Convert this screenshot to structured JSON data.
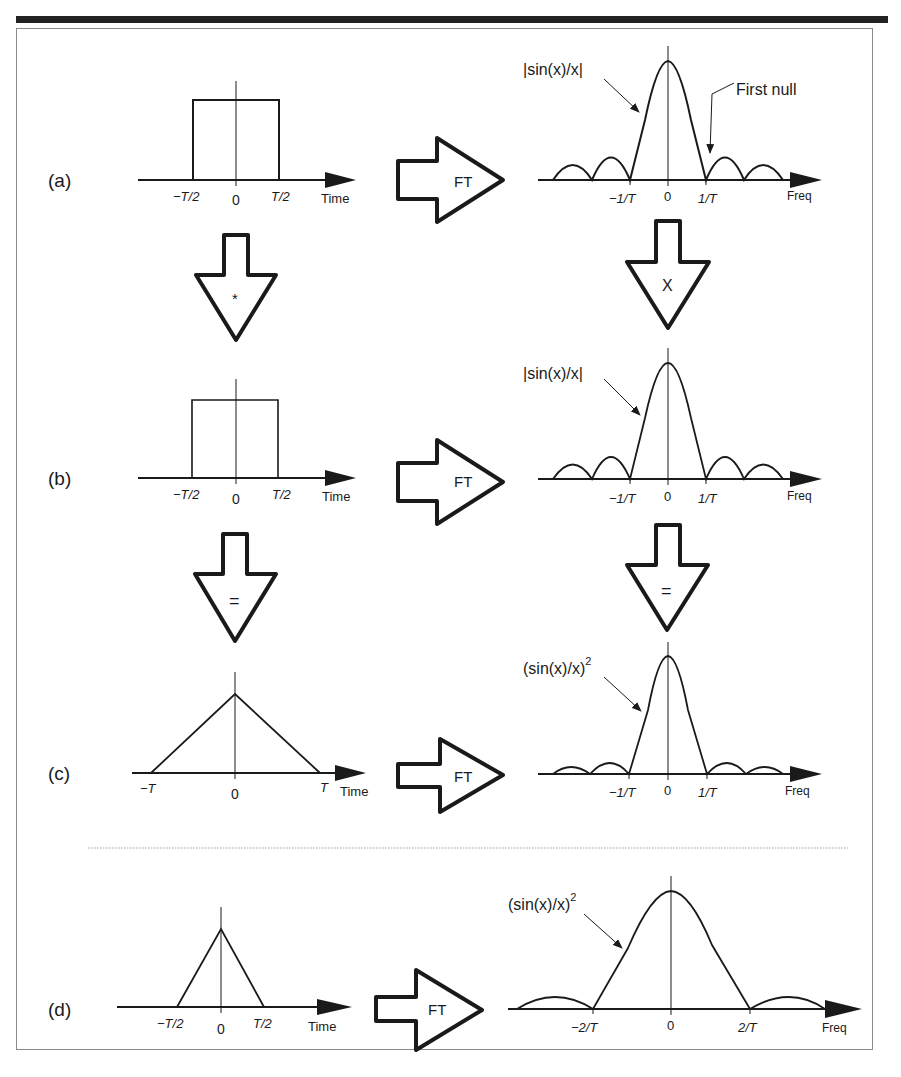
{
  "figure": {
    "rows": [
      {
        "id": "a",
        "label": "(a)",
        "time": {
          "shape": "rect",
          "ticks": [
            "−T/2",
            "0",
            "T/2"
          ],
          "axis_label": "Time"
        },
        "transform": "FT",
        "freq": {
          "shape": "|sin(x)/x|",
          "curve_label": "|sin(x)/x|",
          "annotation": "First null",
          "ticks": [
            "−1/T",
            "0",
            "1/T"
          ],
          "axis_label": "Freq"
        }
      },
      {
        "id": "b",
        "label": "(b)",
        "time": {
          "shape": "rect",
          "ticks": [
            "−T/2",
            "0",
            "T/2"
          ],
          "axis_label": "Time"
        },
        "transform": "FT",
        "freq": {
          "shape": "|sin(x)/x|",
          "curve_label": "|sin(x)/x|",
          "ticks": [
            "−1/T",
            "0",
            "1/T"
          ],
          "axis_label": "Freq"
        }
      },
      {
        "id": "c",
        "label": "(c)",
        "time": {
          "shape": "triangle",
          "ticks": [
            "−T",
            "0",
            "T"
          ],
          "axis_label": "Time"
        },
        "transform": "FT",
        "freq": {
          "shape": "(sin(x)/x)^2",
          "curve_label": "(sin(x)/x)",
          "curve_label_sup": "2",
          "ticks": [
            "−1/T",
            "0",
            "1/T"
          ],
          "axis_label": "Freq"
        }
      },
      {
        "id": "d",
        "label": "(d)",
        "time": {
          "shape": "triangle",
          "ticks": [
            "−T/2",
            "0",
            "T/2"
          ],
          "axis_label": "Time"
        },
        "transform": "FT",
        "freq": {
          "shape": "(sin(x)/x)^2",
          "curve_label": "(sin(x)/x)",
          "curve_label_sup": "2",
          "ticks": [
            "−2/T",
            "0",
            "2/T"
          ],
          "axis_label": "Freq"
        }
      }
    ],
    "down_arrows": {
      "time_ab": "*",
      "freq_ab": "X",
      "time_bc": "=",
      "freq_bc": "="
    }
  },
  "colors": {
    "ink": "#1a1a1a",
    "frame": "#8a8a8a",
    "bar": "#222222",
    "separator": "#9a9a9a"
  }
}
